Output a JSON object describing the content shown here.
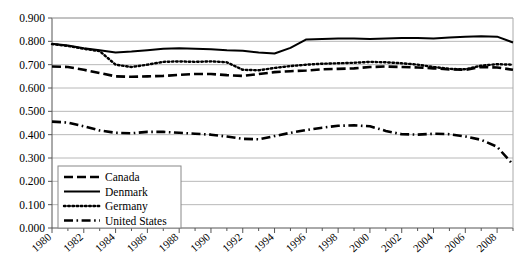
{
  "chart_data": {
    "type": "line",
    "title": "",
    "xlabel": "",
    "ylabel": "",
    "grid": true,
    "legend_position": "lower-left-inside",
    "xlim": [
      1980,
      2009
    ],
    "ylim": [
      0.0,
      0.9
    ],
    "ytick_labels": [
      "0.900",
      "0.800",
      "0.700",
      "0.600",
      "0.500",
      "0.400",
      "0.300",
      "0.200",
      "0.100",
      "0.000"
    ],
    "ytick_values": [
      0.9,
      0.8,
      0.7,
      0.6,
      0.5,
      0.4,
      0.3,
      0.2,
      0.1,
      0.0
    ],
    "xtick_labels": [
      "1980",
      "1982",
      "1984",
      "1986",
      "1988",
      "1990",
      "1992",
      "1994",
      "1996",
      "1998",
      "2000",
      "2002",
      "2004",
      "2006",
      "2008"
    ],
    "xtick_values": [
      1980,
      1982,
      1984,
      1986,
      1988,
      1990,
      1992,
      1994,
      1996,
      1998,
      2000,
      2002,
      2004,
      2006,
      2008
    ],
    "x": [
      1980,
      1981,
      1982,
      1983,
      1984,
      1985,
      1986,
      1987,
      1988,
      1989,
      1990,
      1991,
      1992,
      1993,
      1994,
      1995,
      1996,
      1997,
      1998,
      1999,
      2000,
      2001,
      2002,
      2003,
      2004,
      2005,
      2006,
      2007,
      2008,
      2009
    ],
    "series": [
      {
        "name": "Canada",
        "style": "dashed",
        "color": "#000000",
        "values": [
          0.692,
          0.69,
          0.678,
          0.664,
          0.65,
          0.648,
          0.65,
          0.652,
          0.656,
          0.66,
          0.66,
          0.655,
          0.652,
          0.66,
          0.668,
          0.672,
          0.675,
          0.68,
          0.682,
          0.684,
          0.69,
          0.692,
          0.69,
          0.688,
          0.684,
          0.68,
          0.678,
          0.69,
          0.688,
          0.678
        ]
      },
      {
        "name": "Denmark",
        "style": "solid",
        "color": "#000000",
        "values": [
          0.79,
          0.782,
          0.77,
          0.762,
          0.752,
          0.756,
          0.762,
          0.768,
          0.77,
          0.768,
          0.766,
          0.762,
          0.76,
          0.752,
          0.748,
          0.772,
          0.808,
          0.81,
          0.812,
          0.812,
          0.81,
          0.812,
          0.814,
          0.814,
          0.812,
          0.816,
          0.82,
          0.822,
          0.82,
          0.795
        ]
      },
      {
        "name": "Germany",
        "style": "dotted",
        "color": "#000000",
        "values": [
          0.788,
          0.78,
          0.768,
          0.758,
          0.7,
          0.69,
          0.7,
          0.712,
          0.714,
          0.712,
          0.714,
          0.71,
          0.678,
          0.676,
          0.686,
          0.694,
          0.7,
          0.704,
          0.706,
          0.708,
          0.712,
          0.71,
          0.706,
          0.7,
          0.69,
          0.682,
          0.68,
          0.696,
          0.702,
          0.7
        ]
      },
      {
        "name": "United States",
        "style": "dashdot",
        "color": "#000000",
        "values": [
          0.456,
          0.452,
          0.436,
          0.418,
          0.408,
          0.406,
          0.412,
          0.412,
          0.408,
          0.404,
          0.4,
          0.392,
          0.382,
          0.38,
          0.394,
          0.408,
          0.42,
          0.43,
          0.438,
          0.44,
          0.436,
          0.416,
          0.402,
          0.4,
          0.404,
          0.402,
          0.392,
          0.378,
          0.348,
          0.272
        ]
      }
    ],
    "legend": [
      {
        "label": "Canada",
        "style": "dashed"
      },
      {
        "label": "Denmark",
        "style": "solid"
      },
      {
        "label": "Germany",
        "style": "dotted"
      },
      {
        "label": "United States",
        "style": "dashdot"
      }
    ]
  }
}
